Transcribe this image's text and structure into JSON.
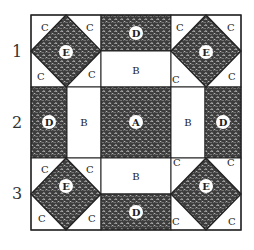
{
  "diagram": {
    "type": "quilt-block",
    "grid": "3x3",
    "fill_color": "#3d3d3d",
    "line_color": "#222222",
    "row_labels": [
      "1",
      "2",
      "3"
    ],
    "pieces": {
      "A": {
        "count": 1,
        "shape": "square",
        "fabric": "patterned",
        "position": "center"
      },
      "B": {
        "count": 4,
        "shape": "rectangle",
        "fabric": "plain",
        "position": "adjacent to center"
      },
      "C": {
        "count": 16,
        "shape": "triangle",
        "fabric": "plain",
        "position": "corner block corners"
      },
      "D": {
        "count": 4,
        "shape": "rectangle",
        "fabric": "patterned",
        "position": "outer edge middles"
      },
      "E": {
        "count": 4,
        "shape": "square-on-point",
        "fabric": "patterned",
        "position": "corner blocks"
      }
    },
    "labels": {
      "A": "A",
      "B": "B",
      "C": "C",
      "D": "D",
      "E": "E"
    }
  }
}
